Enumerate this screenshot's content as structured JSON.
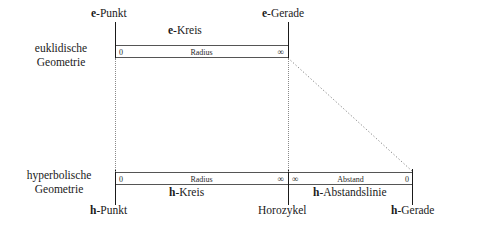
{
  "diagram": {
    "rows": {
      "euclidean": {
        "line1": "euklidische",
        "line2": "Geometrie"
      },
      "hyperbolic": {
        "line1": "hyperbolische",
        "line2": "Geometrie"
      }
    },
    "bars": {
      "e_kreis": {
        "quantity": "Radius",
        "left_value": "0",
        "right_value": "∞"
      },
      "h_kreis": {
        "quantity": "Radius",
        "left_value": "0",
        "right_value": "∞"
      },
      "h_abstandslinie": {
        "quantity": "Abstand",
        "left_value": "∞",
        "right_value": "0"
      }
    },
    "captions": {
      "e_punkt_prefix": "e",
      "e_punkt_rest": "-Punkt",
      "e_kreis_prefix": "e",
      "e_kreis_rest": "-Kreis",
      "e_gerade_prefix": "e",
      "e_gerade_rest": "-Gerade",
      "h_kreis_prefix": "h",
      "h_kreis_rest": "-Kreis",
      "h_abstandslinie_prefix": "h",
      "h_abstandslinie_rest": "-Abstandslinie",
      "h_punkt_prefix": "h",
      "h_punkt_rest": "-Punkt",
      "horozykel": "Horozykel",
      "h_gerade_prefix": "h",
      "h_gerade_rest": "-Gerade"
    },
    "colors": {
      "background": "#ffffff",
      "ink": "#1a1a1a",
      "bar_rule": "#555555",
      "dotted": "#8a8a8a"
    }
  }
}
